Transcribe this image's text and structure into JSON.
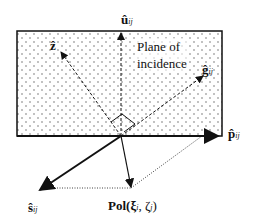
{
  "diagram": {
    "title_label": "Plane of",
    "title_label2": "incidence",
    "labels": {
      "u": "û",
      "u_sub": "ij",
      "z": "ẑ",
      "g": "ĝ",
      "g_sub": "ij",
      "p": "p̂",
      "p_sub": "ij",
      "s": "ŝ",
      "s_sub": "ij",
      "pol": "Pol(ξ",
      "pol_sub_i": "i",
      "pol_mid": ", ζ",
      "pol_sub_j": "j",
      "pol_end": ")"
    },
    "colors": {
      "line": "#111111",
      "fill": "#ffffff",
      "dots": "#555555"
    }
  }
}
